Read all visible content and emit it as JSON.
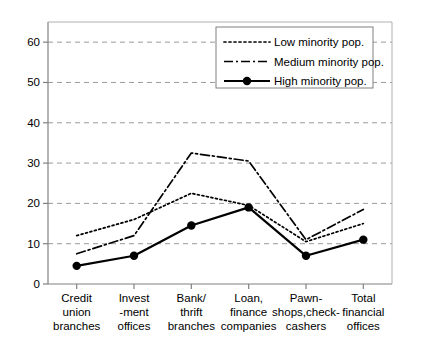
{
  "chart_data": {
    "type": "line",
    "title": "",
    "xlabel": "",
    "ylabel": "",
    "ylim": [
      0,
      65
    ],
    "yticks": [
      0,
      10,
      20,
      30,
      40,
      50,
      60
    ],
    "ytick_labels": [
      "0",
      "10",
      "20",
      "30",
      "40",
      "50",
      "60"
    ],
    "grid": true,
    "grid_axis": "y",
    "legend_position": "upper center",
    "categories": [
      "Credit union branches",
      "Invest -ment offices",
      "Bank/ thrift branches",
      "Loan, finance companies",
      "Pawn- shops,check- cashers",
      "Total financial offices"
    ],
    "category_lines": [
      [
        "Credit",
        "union",
        "branches"
      ],
      [
        "Invest",
        "-ment",
        "offices"
      ],
      [
        "Bank/",
        "thrift",
        "branches"
      ],
      [
        "Loan,",
        "finance",
        "companies"
      ],
      [
        "Pawn-",
        "shops,check-",
        "cashers"
      ],
      [
        "Total",
        "financial",
        "offices"
      ]
    ],
    "series": [
      {
        "name": "Low minority pop.",
        "style": "dotted",
        "marker": "none",
        "color": "#000000",
        "values": [
          12,
          16,
          22.5,
          19.5,
          10.5,
          15
        ]
      },
      {
        "name": "Medium minority pop.",
        "style": "dash-dot",
        "marker": "none",
        "color": "#000000",
        "values": [
          7.5,
          12,
          32.5,
          30.5,
          11,
          18.5
        ]
      },
      {
        "name": "High minority pop.",
        "style": "solid",
        "marker": "circle",
        "color": "#000000",
        "values": [
          4.5,
          7,
          14.5,
          19,
          7,
          11
        ]
      }
    ]
  },
  "legend": {
    "items": [
      {
        "label": "Low minority pop.",
        "swatch": "dotted-line-icon"
      },
      {
        "label": "Medium minority pop.",
        "swatch": "dash-dot-line-icon"
      },
      {
        "label": "High minority pop.",
        "swatch": "solid-line-marker-icon"
      }
    ]
  },
  "colors": {
    "line": "#000000",
    "grid": "#9a9a9a",
    "axis": "#808080",
    "background": "#ffffff",
    "legend_border": "#808080"
  }
}
